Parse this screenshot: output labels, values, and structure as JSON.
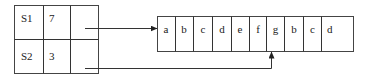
{
  "table": {
    "rows": [
      {
        "name": "S1",
        "length": "7"
      },
      {
        "name": "S2",
        "length": "3"
      }
    ]
  },
  "string_array": {
    "chars": [
      "a",
      "b",
      "c",
      "d",
      "e",
      "f",
      "g",
      "b",
      "c",
      "d",
      ""
    ]
  },
  "pointers": [
    {
      "from": "S1",
      "to_index": 0
    },
    {
      "from": "S2",
      "to_index": 6
    }
  ]
}
